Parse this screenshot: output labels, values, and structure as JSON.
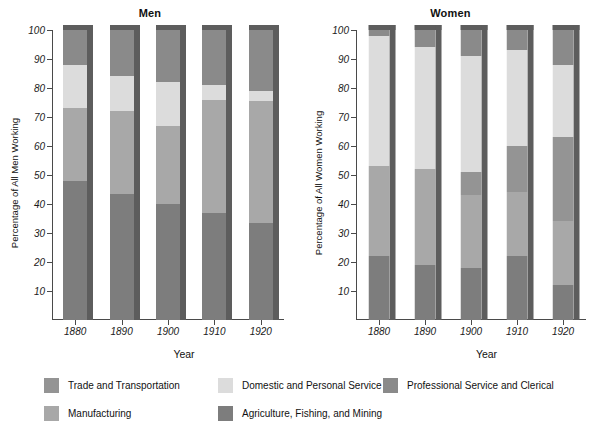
{
  "chart_data": {
    "type": "bar",
    "subtype": "stacked-bar-100-percent",
    "grid": false,
    "legend_position": "bottom",
    "panels": [
      {
        "title": "Men",
        "xlabel": "Year",
        "ylabel": "Percentage of All Men Working",
        "categories": [
          "1880",
          "1890",
          "1900",
          "1910",
          "1920"
        ],
        "ylim": [
          0,
          100
        ],
        "yticks": [
          10,
          20,
          30,
          40,
          50,
          60,
          70,
          80,
          90,
          100
        ],
        "series": [
          {
            "name": "Agriculture, Fishing, and Mining",
            "color": "#8c8c8c",
            "values": [
              48,
              43.5,
              40,
              37,
              33.5
            ]
          },
          {
            "name": "Manufacturing",
            "color": "#a8a8a8",
            "values": [
              25,
              28.5,
              27,
              39,
              42
            ]
          },
          {
            "name": "Trade and Transportation",
            "color": "#949494",
            "values": [
              0,
              0,
              0,
              0,
              0
            ]
          },
          {
            "name": "Domestic and Personal Service",
            "color": "#dcdcdc",
            "values": [
              15,
              12,
              15,
              5,
              3.5
            ]
          },
          {
            "name": "Professional Service and Clerical",
            "color": "#8a8a8a",
            "values": [
              12,
              16,
              18,
              19,
              21
            ]
          }
        ],
        "stack_order": [
          "Agriculture, Fishing, and Mining",
          "Manufacturing",
          "Domestic and Personal Service",
          "Professional Service and Clerical"
        ],
        "stack_boundaries": {
          "1880": [
            48,
            73,
            88,
            100
          ],
          "1890": [
            43.5,
            72,
            84,
            100
          ],
          "1900": [
            40,
            67,
            82,
            100
          ],
          "1910": [
            37,
            76,
            81,
            100
          ],
          "1920": [
            33.5,
            75.5,
            79,
            100
          ]
        }
      },
      {
        "title": "Women",
        "xlabel": "Year",
        "ylabel": "Percentage of All Women Working",
        "categories": [
          "1880",
          "1890",
          "1900",
          "1910",
          "1920"
        ],
        "ylim": [
          0,
          100
        ],
        "yticks": [
          10,
          20,
          30,
          40,
          50,
          60,
          70,
          80,
          90,
          100
        ],
        "series": [
          {
            "name": "Agriculture, Fishing, and Mining",
            "color": "#8c8c8c",
            "values": [
              22,
              19,
              18,
              22,
              12
            ]
          },
          {
            "name": "Manufacturing",
            "color": "#a8a8a8",
            "values": [
              31,
              33,
              25,
              22,
              22
            ]
          },
          {
            "name": "Trade and Transportation",
            "color": "#949494",
            "values": [
              0,
              0,
              8,
              16,
              29
            ]
          },
          {
            "name": "Domestic and Personal Service",
            "color": "#dcdcdc",
            "values": [
              45,
              42,
              40,
              33,
              25
            ]
          },
          {
            "name": "Professional Service and Clerical",
            "color": "#8a8a8a",
            "values": [
              2,
              6,
              9,
              7,
              12
            ]
          }
        ],
        "stack_order": [
          "Agriculture, Fishing, and Mining",
          "Manufacturing",
          "Trade and Transportation",
          "Domestic and Personal Service",
          "Professional Service and Clerical"
        ],
        "stack_boundaries": {
          "1880": [
            22,
            53,
            53,
            98,
            100
          ],
          "1890": [
            19,
            52,
            52,
            94,
            100
          ],
          "1900": [
            18,
            43,
            51,
            91,
            100
          ],
          "1910": [
            22,
            44,
            60,
            93,
            100
          ],
          "1920": [
            12,
            34,
            63,
            88,
            100
          ]
        }
      }
    ],
    "legend": [
      {
        "label": "Trade and Transportation",
        "color": "#949494"
      },
      {
        "label": "Domestic and Personal Service",
        "color": "#dcdcdc"
      },
      {
        "label": "Professional Service and Clerical",
        "color": "#8a8a8a"
      },
      {
        "label": "Manufacturing",
        "color": "#a8a8a8"
      },
      {
        "label": "Agriculture, Fishing, and Mining",
        "color": "#7d7d7d"
      }
    ]
  },
  "colors": {
    "trade": "#949494",
    "domestic": "#dcdcdc",
    "professional": "#8a8a8a",
    "manufacturing": "#a8a8a8",
    "agriculture": "#7d7d7d",
    "bar_shadow": "#5d5d5d",
    "axis": "#4a4a4a",
    "background": "#ffffff"
  }
}
